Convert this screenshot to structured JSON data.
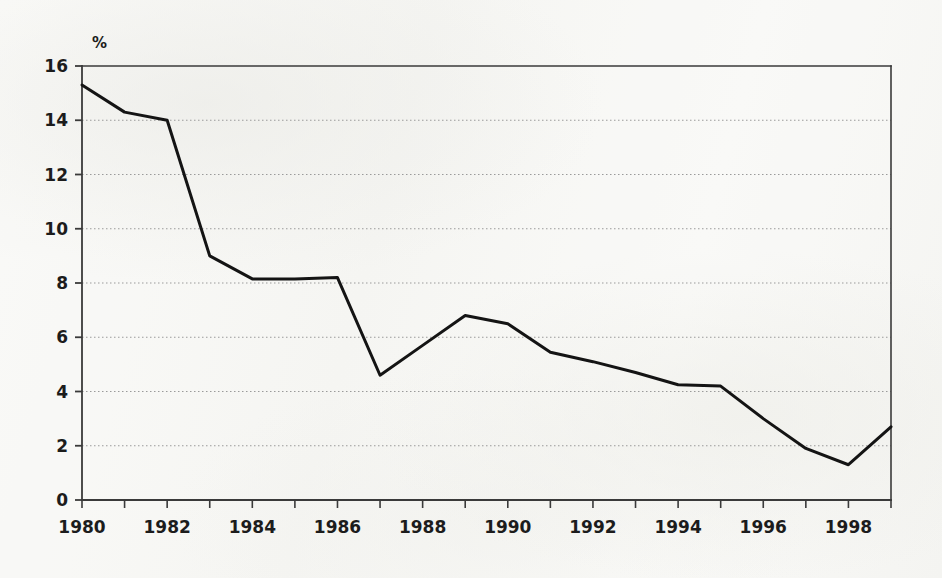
{
  "chart_data": {
    "type": "line",
    "title": "",
    "subtitle": "",
    "xlabel": "",
    "ylabel": "",
    "unit_label": "%",
    "unit_label_position": "top-left-above-axis",
    "grid": true,
    "grid_style": "dotted-horizontal",
    "legend": null,
    "legend_position": "none",
    "xlim": [
      1980,
      1999
    ],
    "ylim": [
      0,
      16
    ],
    "y_ticks": [
      0,
      2,
      4,
      6,
      8,
      10,
      12,
      14,
      16
    ],
    "y_tick_labels": [
      "0",
      "2",
      "4",
      "6",
      "8",
      "10",
      "12",
      "14",
      "16"
    ],
    "x_ticks": [
      1980,
      1981,
      1982,
      1983,
      1984,
      1985,
      1986,
      1987,
      1988,
      1989,
      1990,
      1991,
      1992,
      1993,
      1994,
      1995,
      1996,
      1997,
      1998,
      1999
    ],
    "x_tick_labels_shown": [
      "1980",
      "1982",
      "1984",
      "1986",
      "1988",
      "1990",
      "1992",
      "1994",
      "1996",
      "1998"
    ],
    "x_labeled_years": [
      1980,
      1982,
      1984,
      1986,
      1988,
      1990,
      1992,
      1994,
      1996,
      1998
    ],
    "x": [
      1980,
      1981,
      1982,
      1983,
      1984,
      1985,
      1986,
      1987,
      1988,
      1989,
      1990,
      1991,
      1992,
      1993,
      1994,
      1995,
      1996,
      1997,
      1998,
      1999
    ],
    "values": [
      15.3,
      14.3,
      14.0,
      9.0,
      8.15,
      8.15,
      8.2,
      4.6,
      5.7,
      6.8,
      6.5,
      5.45,
      5.1,
      4.7,
      4.25,
      4.2,
      3.0,
      1.9,
      1.3,
      2.7
    ],
    "series": [
      {
        "name": "series-1",
        "color": "#141414",
        "line_width": 3,
        "values": [
          15.3,
          14.3,
          14.0,
          9.0,
          8.15,
          8.15,
          8.2,
          4.6,
          5.7,
          6.8,
          6.5,
          5.45,
          5.1,
          4.7,
          4.25,
          4.2,
          3.0,
          1.9,
          1.3,
          2.7
        ]
      }
    ],
    "annotations": []
  },
  "style": {
    "background": "#f8f8f6",
    "axis_color": "#3a3a3a",
    "grid_color": "#9a9a9a",
    "line_color": "#141414",
    "text_color": "#1c1c1c"
  }
}
